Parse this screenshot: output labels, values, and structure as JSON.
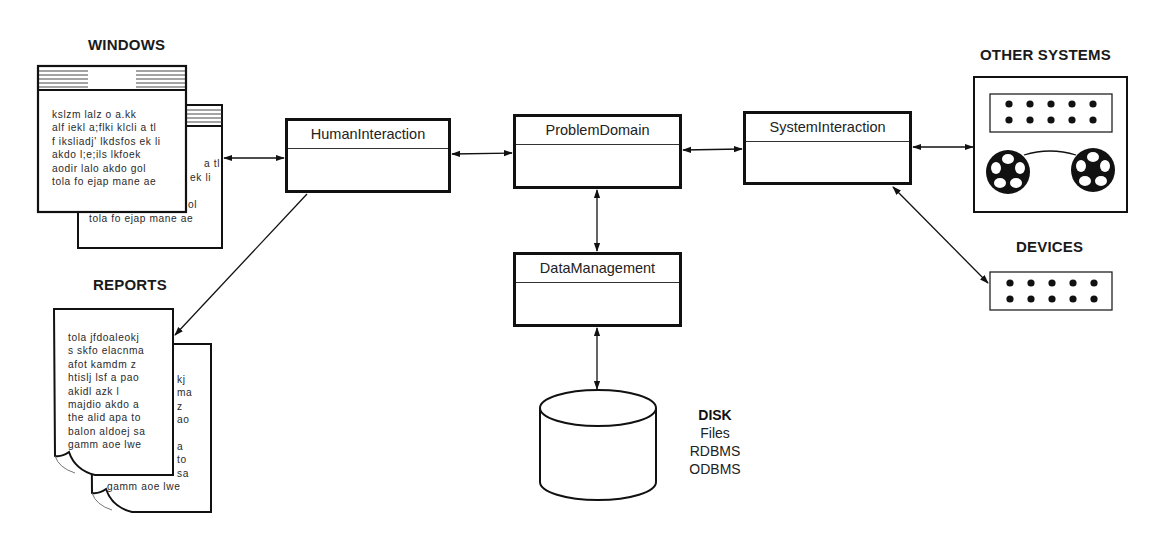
{
  "diagram": {
    "labels": {
      "windows": "WINDOWS",
      "reports": "REPORTS",
      "other_systems": "OTHER SYSTEMS",
      "devices": "DEVICES"
    },
    "classes": {
      "human_interaction": "HumanInteraction",
      "problem_domain": "ProblemDomain",
      "system_interaction": "SystemInteraction",
      "data_management": "DataManagement"
    },
    "disk": {
      "title": "DISK",
      "items": [
        "Files",
        "RDBMS",
        "ODBMS"
      ]
    },
    "window_front_lines": [
      "kslzm lalz o a.kk",
      "alf iekl a;flki klcli a tl",
      "f iksliadj' lkdsfos ek li",
      "akdo l;e;ils lkfoek",
      "aodir lalo akdo gol",
      "tola fo ejap mane ae"
    ],
    "window_back_lines": {
      "peek_1": "a tl",
      "peek_2": "ek li",
      "peek_3": "ol",
      "last": "tola fo ejap mane ae"
    },
    "report_front_lines": [
      "tola jfdoaleokj",
      "s skfo elacnma",
      "afot kamdm z",
      "htislj lsf a pao",
      "akidl azk l",
      "majdio akdo a",
      "the alid apa to",
      "balon aldoej sa",
      "gamm aoe lwe"
    ],
    "report_back_lines": {
      "peek": [
        "kj",
        "ma",
        "z",
        "ao",
        "",
        "a",
        "to",
        "sa"
      ],
      "last": "gamm aoe lwe"
    },
    "connections": [
      {
        "from": "windows",
        "to": "human_interaction",
        "type": "bidirectional"
      },
      {
        "from": "human_interaction",
        "to": "problem_domain",
        "type": "bidirectional"
      },
      {
        "from": "problem_domain",
        "to": "system_interaction",
        "type": "bidirectional"
      },
      {
        "from": "system_interaction",
        "to": "other_systems",
        "type": "bidirectional"
      },
      {
        "from": "system_interaction",
        "to": "devices",
        "type": "bidirectional"
      },
      {
        "from": "problem_domain",
        "to": "data_management",
        "type": "bidirectional"
      },
      {
        "from": "data_management",
        "to": "disk",
        "type": "bidirectional"
      },
      {
        "from": "human_interaction",
        "to": "reports",
        "type": "directed"
      }
    ]
  }
}
